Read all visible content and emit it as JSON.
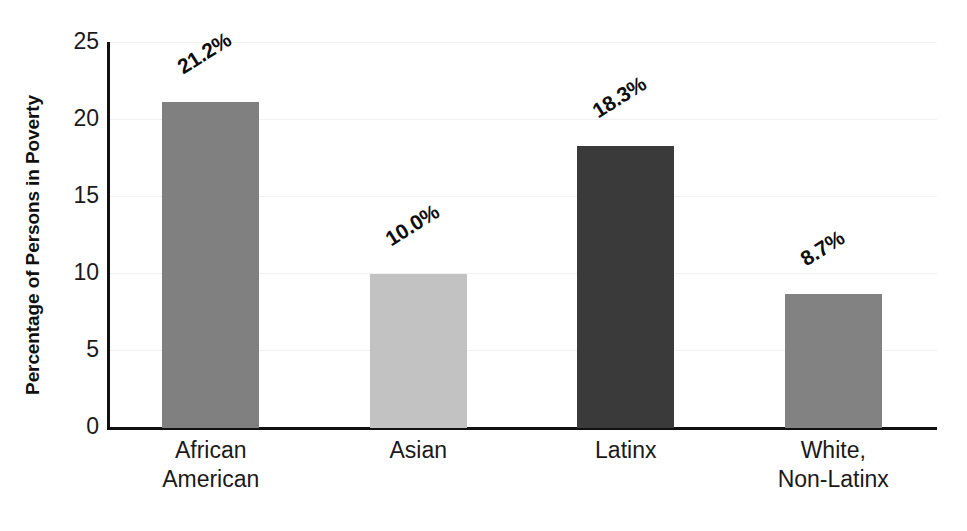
{
  "chart_data": {
    "type": "bar",
    "title": "",
    "subtitle": "",
    "xlabel": "",
    "ylabel": "Percentage of Persons in Poverty",
    "categories": [
      "African American",
      "Asian",
      "Latinx",
      "White, Non-Latinx"
    ],
    "category_lines": [
      [
        "African",
        "American"
      ],
      [
        "Asian"
      ],
      [
        "Latinx"
      ],
      [
        "White,",
        "Non-Latinx"
      ]
    ],
    "values": [
      21.2,
      10.0,
      18.3,
      8.7
    ],
    "data_labels": [
      "21.2%",
      "10.0%",
      "18.3%",
      "8.7%"
    ],
    "bar_colors": [
      "#808080",
      "#c2c2c2",
      "#3a3a3a",
      "#828282"
    ],
    "ylim": [
      0,
      25
    ],
    "ytick_values": [
      0,
      5,
      10,
      15,
      20,
      25
    ],
    "ytick_labels": [
      "0",
      "5",
      "10",
      "15",
      "20",
      "25"
    ],
    "grid": true,
    "grid_axis": "y",
    "legend": false,
    "legend_position": "none",
    "axis_color": "#111111",
    "background_color": "#ffffff",
    "data_label_rotation_deg": -32
  }
}
